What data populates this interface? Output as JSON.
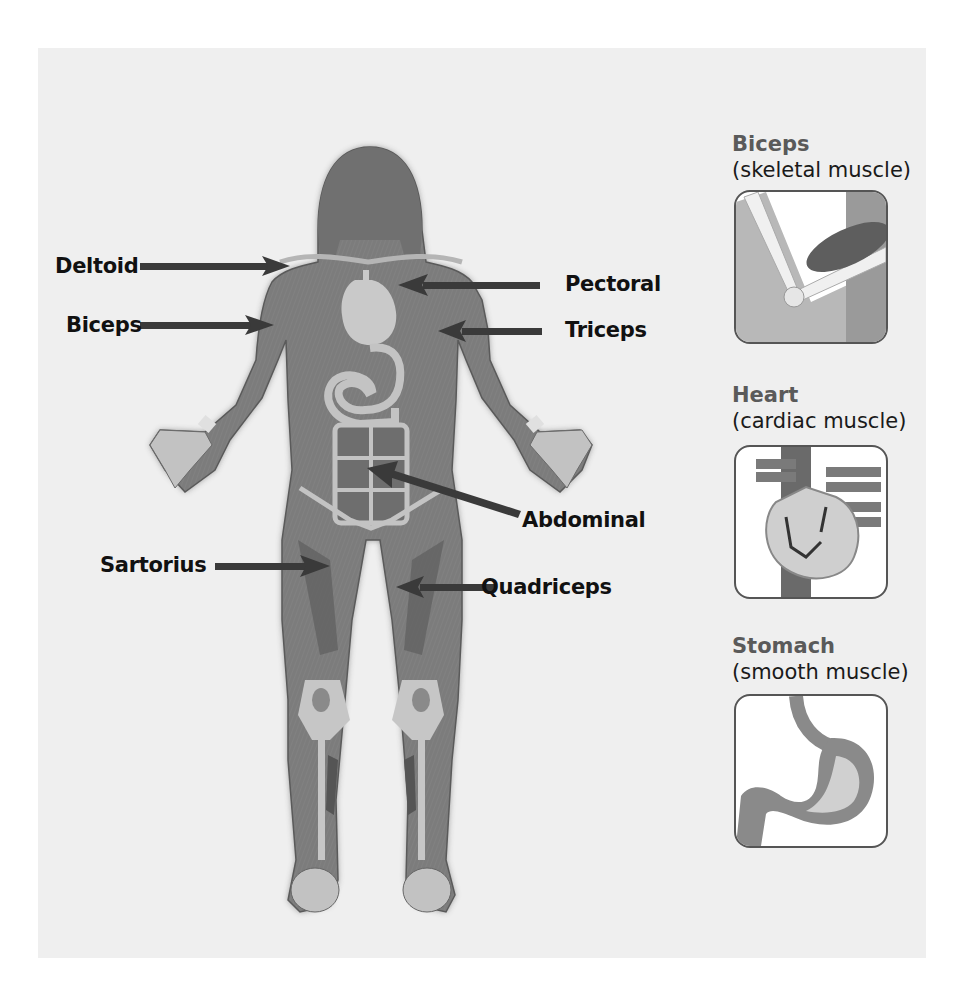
{
  "diagram": {
    "colors": {
      "background": "#ffffff",
      "panel": "#efefef",
      "muscle": "#7a7a7a",
      "muscle_dark": "#5e5e5e",
      "tendon": "#c9c9c9",
      "organ": "#bdbdbd",
      "arrow": "#3a3a3a",
      "label_text": "#111111",
      "inset_title": "#5a5a5a"
    },
    "body_labels": [
      {
        "id": "deltoid",
        "text": "Deltoid",
        "side": "left"
      },
      {
        "id": "biceps",
        "text": "Biceps",
        "side": "left"
      },
      {
        "id": "pectoral",
        "text": "Pectoral",
        "side": "right"
      },
      {
        "id": "triceps",
        "text": "Triceps",
        "side": "right"
      },
      {
        "id": "abdominal",
        "text": "Abdominal",
        "side": "right"
      },
      {
        "id": "sartorius",
        "text": "Sartorius",
        "side": "left"
      },
      {
        "id": "quadriceps",
        "text": "Quadriceps",
        "side": "right"
      }
    ],
    "insets": [
      {
        "id": "biceps",
        "title": "Biceps",
        "subtitle": "(skeletal muscle)",
        "icon": "arm-elbow-icon"
      },
      {
        "id": "heart",
        "title": "Heart",
        "subtitle": "(cardiac muscle)",
        "icon": "heart-icon"
      },
      {
        "id": "stomach",
        "title": "Stomach",
        "subtitle": "(smooth muscle)",
        "icon": "stomach-icon"
      }
    ]
  }
}
